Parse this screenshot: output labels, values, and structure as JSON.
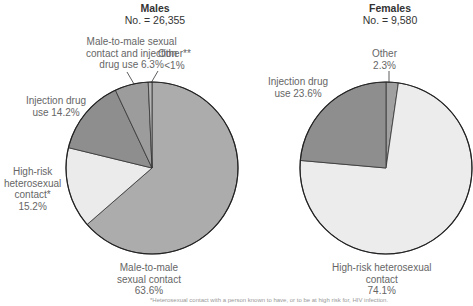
{
  "chart_data": [
    {
      "type": "pie",
      "title": "Males",
      "subtitle": "No. = 26,355",
      "categories": [
        "Male-to-male sexual contact",
        "High-risk heterosexual contact*",
        "Injection drug use",
        "Male-to-male sexual contact and injection drug use",
        "Other**"
      ],
      "values": [
        63.6,
        15.2,
        14.2,
        6.3,
        0.7
      ],
      "value_labels": [
        "63.6%",
        "15.2%",
        "14.2%",
        "6.3%",
        "<1%"
      ],
      "colors": [
        "#acacac",
        "#ebebeb",
        "#8e8e8e",
        "#9c9c9c",
        "#b5b5b5"
      ]
    },
    {
      "type": "pie",
      "title": "Females",
      "subtitle": "No. = 9,580",
      "categories": [
        "Other",
        "High-risk heterosexual contact",
        "Injection drug use"
      ],
      "values": [
        2.3,
        74.1,
        23.6
      ],
      "value_labels": [
        "2.3%",
        "74.1%",
        "23.6%"
      ],
      "colors": [
        "#a0a0a0",
        "#ececec",
        "#8e8e8e"
      ]
    }
  ],
  "males": {
    "title": "Males",
    "count": "No. = 26,355",
    "labels": {
      "mtm_idu": [
        "Male-to-male sexual",
        "contact and injection",
        "drug use 6.3%"
      ],
      "other": [
        "Other**",
        "<1%"
      ],
      "idu": [
        "Injection drug",
        "use 14.2%"
      ],
      "hetero": [
        "High-risk",
        "heterosexual",
        "contact*",
        "15.2%"
      ],
      "mtm": [
        "Male-to-male",
        "sexual contact",
        "63.6%"
      ]
    }
  },
  "females": {
    "title": "Females",
    "count": "No. = 9,580",
    "labels": {
      "other": [
        "Other",
        "2.3%"
      ],
      "idu": [
        "Injection drug",
        "use 23.6%"
      ],
      "hetero": [
        "High-risk heterosexual",
        "contact",
        "74.1%"
      ]
    }
  },
  "footnote": "*Heterosexual contact with a person known to have, or to be at high risk for, HIV infection."
}
